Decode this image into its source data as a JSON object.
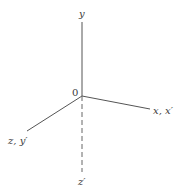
{
  "diagram": {
    "origin_label": "0",
    "axes": [
      {
        "id": "y",
        "label": "y",
        "style": "solid"
      },
      {
        "id": "x",
        "label": "x, x′",
        "style": "solid"
      },
      {
        "id": "z",
        "label": "z, y′",
        "style": "solid"
      },
      {
        "id": "z-prime",
        "label": "z′",
        "style": "dashed"
      }
    ],
    "colors": {
      "line": "#555555",
      "text": "#3a3a3a",
      "background": "#ffffff"
    }
  }
}
